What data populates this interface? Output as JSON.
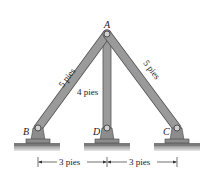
{
  "diagram": {
    "type": "truss-structure",
    "joints": {
      "A": {
        "label": "A"
      },
      "B": {
        "label": "B"
      },
      "C": {
        "label": "C"
      },
      "D": {
        "label": "D"
      }
    },
    "members": [
      {
        "id": "AB",
        "length_label": "5 pies"
      },
      {
        "id": "AD",
        "length_label": "4 pies"
      },
      {
        "id": "AC",
        "length_label": "5 pies"
      }
    ],
    "dimensions": [
      {
        "id": "BD",
        "label": "3 pies"
      },
      {
        "id": "DC",
        "label": "3 pies"
      }
    ],
    "colors": {
      "member_fill": "#9a9a9a",
      "member_stroke": "#555555",
      "ground": "#b8b8b8",
      "support": "#8c8c8c"
    }
  }
}
